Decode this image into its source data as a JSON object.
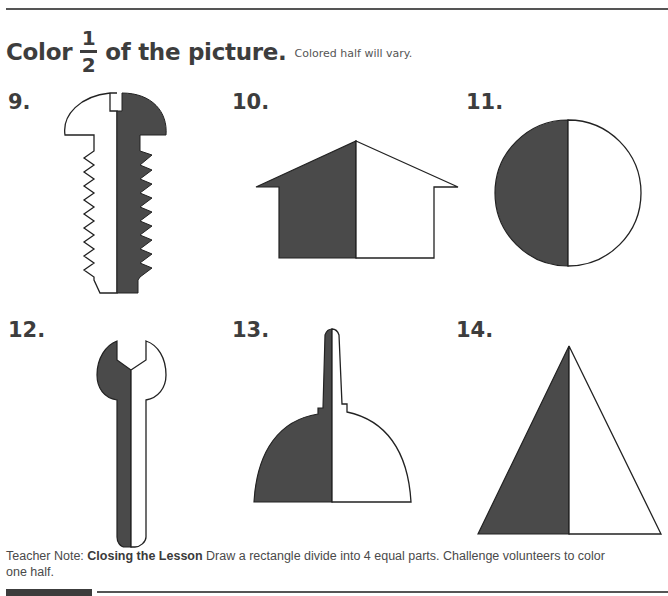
{
  "heading": {
    "prefix": "Color",
    "fraction_numerator": "1",
    "fraction_denominator": "2",
    "suffix": "of the picture.",
    "answer_note": "Colored half will vary."
  },
  "colors": {
    "shaded": "#4a4a4a",
    "outline": "#222222",
    "text": "#3d3d3d"
  },
  "problems": [
    {
      "number": "9.",
      "shape": "screw"
    },
    {
      "number": "10.",
      "shape": "house"
    },
    {
      "number": "11.",
      "shape": "circle"
    },
    {
      "number": "12.",
      "shape": "wrench"
    },
    {
      "number": "13.",
      "shape": "bell"
    },
    {
      "number": "14.",
      "shape": "triangle"
    }
  ],
  "teacher_note": {
    "label": "Teacher Note:",
    "title": "Closing the Lesson",
    "text": "Draw a rectangle divide into 4 equal parts. Challenge volunteers to color one half."
  }
}
